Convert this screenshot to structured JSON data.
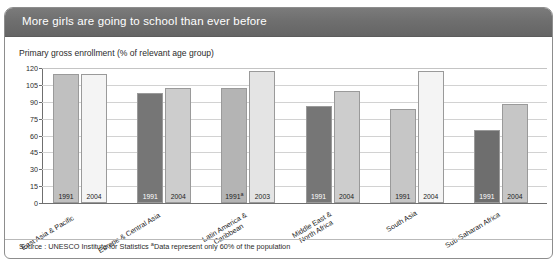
{
  "header": {
    "title": "More girls are going to school than ever before"
  },
  "subtitle": "Primary gross enrollment (% of relevant age group)",
  "source": {
    "text": "Source : UNESCO Institute for Statistics ",
    "footnote_marker": "a",
    "footnote": "Data represent only 60% of the population"
  },
  "colors": {
    "header_bg": "#6e6e6e",
    "bar_dark": "#767676",
    "bar_light": "#c8c8c8",
    "bar_pale": "#f2f2f2",
    "gridline": "#d2d2d2",
    "axis": "#6f6f6f"
  },
  "chart_data": {
    "type": "bar",
    "title": "More girls are going to school than ever before",
    "subtitle": "Primary gross enrollment (% of relevant age group)",
    "xlabel": "",
    "ylabel": "",
    "ylim": [
      0,
      120
    ],
    "yticks": [
      0,
      15,
      30,
      45,
      60,
      75,
      90,
      105,
      120
    ],
    "grid": true,
    "legend": "none",
    "categories": [
      "East Asia & Pacific",
      "Europe & Central Asia",
      "Latin America &\nCaribbean",
      "Middle East &\nNorth Africa",
      "South Asia",
      "Sub-Saharan Africa"
    ],
    "groups": [
      {
        "category": "East Asia & Pacific",
        "category_lines": [
          "East Asia & Pacific"
        ],
        "bars": [
          {
            "year": "1991",
            "value": 115,
            "color": "#c0c0c0",
            "footnote": false
          },
          {
            "year": "2004",
            "value": 115,
            "color": "#f4f4f4",
            "footnote": false
          }
        ]
      },
      {
        "category": "Europe & Central Asia",
        "category_lines": [
          "Europe & Central Asia"
        ],
        "bars": [
          {
            "year": "1991",
            "value": 98,
            "color": "#767676",
            "footnote": false
          },
          {
            "year": "2004",
            "value": 102,
            "color": "#cdcdcd",
            "footnote": false
          }
        ]
      },
      {
        "category": "Latin America & Caribbean",
        "category_lines": [
          "Latin America &",
          "Caribbean"
        ],
        "bars": [
          {
            "year": "1991",
            "value": 102,
            "color": "#b4b4b4",
            "footnote": true
          },
          {
            "year": "2003",
            "value": 117,
            "color": "#e4e4e4",
            "footnote": false
          }
        ]
      },
      {
        "category": "Middle East & North Africa",
        "category_lines": [
          "Middle East &",
          "North Africa"
        ],
        "bars": [
          {
            "year": "1991",
            "value": 86,
            "color": "#767676",
            "footnote": false
          },
          {
            "year": "2004",
            "value": 100,
            "color": "#cdcdcd",
            "footnote": false
          }
        ]
      },
      {
        "category": "South Asia",
        "category_lines": [
          "South Asia"
        ],
        "bars": [
          {
            "year": "1991",
            "value": 84,
            "color": "#c6c6c6",
            "footnote": false
          },
          {
            "year": "2004",
            "value": 117,
            "color": "#f4f4f4",
            "footnote": false
          }
        ]
      },
      {
        "category": "Sub-Saharan Africa",
        "category_lines": [
          "Sub-Saharan Africa"
        ],
        "bars": [
          {
            "year": "1991",
            "value": 65,
            "color": "#6e6e6e",
            "footnote": false
          },
          {
            "year": "2004",
            "value": 88,
            "color": "#c6c6c6",
            "footnote": false
          }
        ]
      }
    ]
  }
}
